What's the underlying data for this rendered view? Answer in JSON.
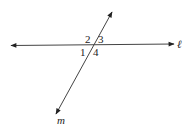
{
  "diagram": {
    "lines": [
      {
        "name": "l",
        "label": "ℓ",
        "type": "horizontal"
      },
      {
        "name": "m",
        "label": "m",
        "type": "transversal"
      }
    ],
    "angles": [
      {
        "id": "1",
        "label": "1"
      },
      {
        "id": "2",
        "label": "2"
      },
      {
        "id": "3",
        "label": "3"
      },
      {
        "id": "4",
        "label": "4"
      }
    ],
    "colors": {
      "stroke": "#333333",
      "text": "#222222",
      "background": "#ffffff"
    }
  }
}
